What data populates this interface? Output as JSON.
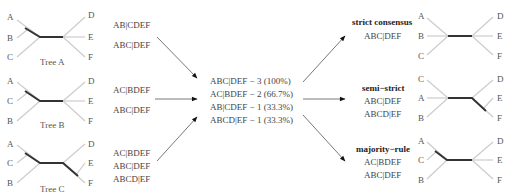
{
  "colors": {
    "background": "#ffffff",
    "internal_branch": "#333333",
    "leaf_branch": "#cccccc",
    "text": "#444444",
    "arrow": "#555555"
  },
  "input_trees": [
    {
      "caption": "Tree A",
      "left_leaves": [
        "A",
        "B",
        "C"
      ],
      "right_leaves": [
        "D",
        "E",
        "F"
      ],
      "splits": [
        "AB|CDEF",
        "ABC|DEF"
      ]
    },
    {
      "caption": "Tree B",
      "left_leaves": [
        "A",
        "C",
        "B"
      ],
      "right_leaves": [
        "D",
        "E",
        "F"
      ],
      "splits": [
        "AC|BDEF",
        "ABC|DEF"
      ]
    },
    {
      "caption": "Tree C",
      "left_leaves": [
        "A",
        "C",
        "B"
      ],
      "right_leaves": [
        "D",
        "E",
        "F"
      ],
      "splits": [
        "AC|BDEF",
        "ABC|DEF",
        "ABCD|EF"
      ]
    }
  ],
  "split_counts": [
    "ABC|DEF − 3 (100%)",
    "AC|BDEF − 2 (66.7%)",
    "AB|CDEF − 1 (33.3%)",
    "ABCD|EF − 1 (33.3%)"
  ],
  "consensus_trees": [
    {
      "method": "strict consensus",
      "left_leaves": [
        "A",
        "B",
        "C"
      ],
      "right_leaves": [
        "D",
        "E",
        "F"
      ],
      "splits": [
        "ABC|DEF"
      ]
    },
    {
      "method": "semi−strict",
      "left_leaves": [
        "C",
        "A",
        "B"
      ],
      "right_leaves": [
        "D",
        "E",
        "F"
      ],
      "splits": [
        "ABC|DEF",
        "ABCD|EF"
      ]
    },
    {
      "method": "majority−rule",
      "left_leaves": [
        "A",
        "C",
        "B"
      ],
      "right_leaves": [
        "D",
        "E",
        "F"
      ],
      "splits": [
        "AC|BDEF",
        "ABC|DEF"
      ]
    }
  ]
}
